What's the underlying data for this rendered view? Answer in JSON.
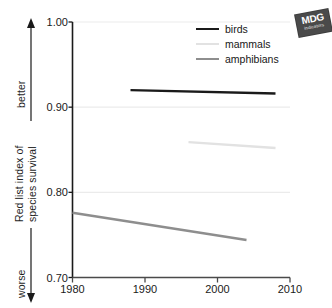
{
  "chart_data": {
    "type": "line",
    "title": "",
    "subtitle": "",
    "xlabel": "",
    "ylabel": "Red list index of species survival",
    "ylabel_lines": [
      "Red list index of",
      "species survival"
    ],
    "xlim": [
      1980,
      2010
    ],
    "ylim": [
      0.7,
      1.0
    ],
    "yticks": [
      "1.00",
      "0.90",
      "0.80",
      "0.70"
    ],
    "ytick_values": [
      1.0,
      0.9,
      0.8,
      0.7
    ],
    "xticks": [
      "1980",
      "1990",
      "2000",
      "2010"
    ],
    "xtick_values": [
      1980,
      1990,
      2000,
      2010
    ],
    "grid": "horizontal",
    "legend_position": "top-right",
    "direction_labels": {
      "up": "better",
      "down": "worse"
    },
    "series": [
      {
        "name": "birds",
        "color": "#1a1a1a",
        "width": 2.4,
        "x": [
          1988,
          2008
        ],
        "values": [
          0.92,
          0.916
        ]
      },
      {
        "name": "mammals",
        "color": "#e2e2e2",
        "width": 2.4,
        "x": [
          1996,
          2008
        ],
        "values": [
          0.859,
          0.852
        ]
      },
      {
        "name": "amphibians",
        "color": "#8e8e8e",
        "width": 2.4,
        "x": [
          1980,
          2004
        ],
        "values": [
          0.776,
          0.744
        ]
      }
    ]
  },
  "legend": {
    "items": [
      {
        "label": "birds"
      },
      {
        "label": "mammals"
      },
      {
        "label": "amphibians"
      }
    ]
  },
  "badge": {
    "main": "MDG",
    "sub": "indicators"
  },
  "colors": {
    "axis": "#1a1a1a",
    "grid": "#ebebeb",
    "birds": "#1a1a1a",
    "mammals": "#e2e2e2",
    "amphibians": "#8e8e8e"
  }
}
